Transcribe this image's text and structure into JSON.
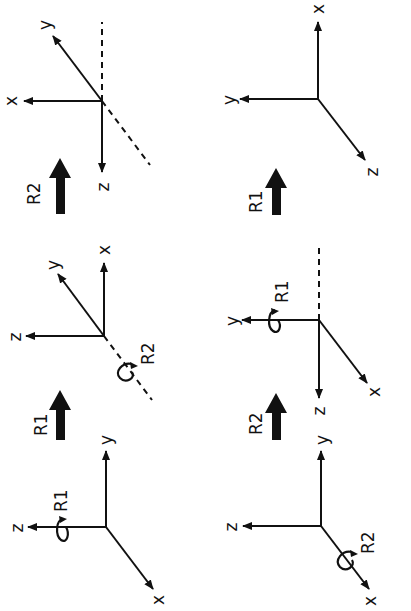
{
  "diagram": {
    "orientation": "rotated 90 degrees clockwise (read with page turned)",
    "colors": {
      "ink": "#111111",
      "background": "#ffffff"
    },
    "sequence_top": {
      "description": "Rotation R1 then R2",
      "frames": [
        {
          "id": "initial",
          "axes": {
            "x": "x",
            "y": "y",
            "z": "z"
          },
          "rotation_marker": {
            "label": "R",
            "subscript": "1",
            "about_axis": "z"
          }
        },
        {
          "id": "after-R1",
          "axes": {
            "x": "x",
            "y": "y",
            "z": "z"
          },
          "rotation_marker": {
            "label": "R",
            "subscript": "2",
            "about_axis": "dashed original x"
          }
        },
        {
          "id": "after-R1-R2",
          "axes": {
            "x": "x",
            "y": "y",
            "z": "z"
          }
        }
      ],
      "transitions": [
        {
          "label": "R",
          "subscript": "1"
        },
        {
          "label": "R",
          "subscript": "2"
        }
      ]
    },
    "sequence_bottom": {
      "description": "Rotation R2 then R1",
      "frames": [
        {
          "id": "initial",
          "axes": {
            "x": "x",
            "y": "y",
            "z": "z"
          },
          "rotation_marker": {
            "label": "R",
            "subscript": "2",
            "about_axis": "x"
          }
        },
        {
          "id": "after-R2",
          "axes": {
            "x": "x",
            "y": "y",
            "z": "z"
          },
          "rotation_marker": {
            "label": "R",
            "subscript": "1",
            "about_axis": "y (dashed original z)"
          }
        },
        {
          "id": "after-R2-R1",
          "axes": {
            "x": "x",
            "y": "y",
            "z": "z"
          }
        }
      ],
      "transitions": [
        {
          "label": "R",
          "subscript": "2"
        },
        {
          "label": "R",
          "subscript": "1"
        }
      ]
    }
  }
}
